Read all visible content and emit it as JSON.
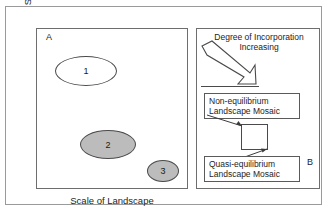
{
  "figure": {
    "panel_a": {
      "label": "A",
      "y_axis_label": "Scale of Disturbance",
      "x_axis_label": "Scale of Landscape",
      "ellipses": [
        {
          "label": "1",
          "fill": "#ffffff"
        },
        {
          "label": "2",
          "fill": "#bcbcbc"
        },
        {
          "label": "3",
          "fill": "#bcbcbc"
        }
      ]
    },
    "panel_b": {
      "label": "B",
      "caption_line1": "Degree of Incorporation",
      "caption_line2": "Increasing",
      "arrow_icon": "thick-outline-arrow-down-right",
      "non_equilibrium": {
        "line1": "Non-equilibrium",
        "line2": "Landscape Mosaic"
      },
      "quasi_equilibrium": {
        "line1": "Quasi-equilibrium",
        "line2": "Landscape Mosaic"
      },
      "center_node": ""
    }
  },
  "colors": {
    "outer_frame": "#9a9a9a",
    "panel_border": "#6e6e6e",
    "stroke": "#4a4a4a",
    "shaded_fill": "#bcbcbc",
    "text": "#232323"
  }
}
